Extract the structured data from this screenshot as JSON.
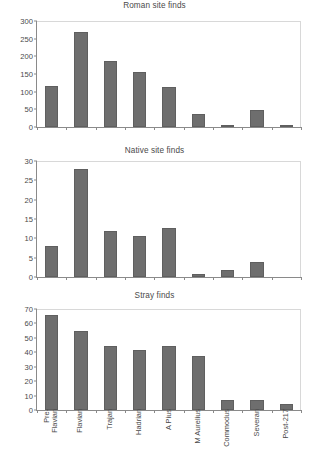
{
  "figure": {
    "background": "#ffffff",
    "bar_color": "#6e6e6e",
    "axis_color": "#8a8a8a",
    "text_color": "#4a4a4a"
  },
  "categories": [
    "Pre-\nFlavian",
    "Flavian",
    "Trajan",
    "Hadrian",
    "A Pius",
    "M Aurelius",
    "Commodus",
    "Severan",
    "Post-217"
  ],
  "charts": [
    {
      "title": "Roman site finds",
      "yticks": [
        "0",
        "50",
        "100",
        "150",
        "200",
        "250",
        "300"
      ],
      "values": [
        115,
        270,
        188,
        157,
        112,
        37,
        4,
        47,
        2
      ],
      "ylim_min": 0,
      "ylim_max": 300,
      "show_xlabels": false
    },
    {
      "title": "Native site finds",
      "yticks": [
        "0",
        "5",
        "10",
        "15",
        "20",
        "25",
        "30"
      ],
      "values": [
        8,
        28,
        12,
        10.7,
        12.7,
        0.8,
        1.8,
        3.8,
        0
      ],
      "ylim_min": 0,
      "ylim_max": 30,
      "show_xlabels": false
    },
    {
      "title": "Stray finds",
      "yticks": [
        "0",
        "10",
        "20",
        "30",
        "40",
        "50",
        "60",
        "70"
      ],
      "values": [
        66,
        55,
        44.7,
        41.5,
        44.3,
        37.2,
        7.2,
        7.2,
        4
      ],
      "ylim_min": 0,
      "ylim_max": 70,
      "show_xlabels": true
    }
  ],
  "chart_data": {
    "type": "bar",
    "xlabel": "",
    "ylabel": "",
    "grid": false,
    "legend": "none",
    "layout": "3 stacked panels, shared categories, rotated x tick labels on bottom panel only",
    "categories": [
      "Pre-Flavian",
      "Flavian",
      "Trajan",
      "Hadrian",
      "A Pius",
      "M Aurelius",
      "Commodus",
      "Severan",
      "Post-217"
    ],
    "panels": [
      {
        "title": "Roman site finds",
        "ylim": [
          0,
          300
        ],
        "ytick_step": 50,
        "ytick_labels": [
          "0",
          "50",
          "100",
          "150",
          "200",
          "250",
          "300"
        ],
        "values": [
          115,
          270,
          188,
          157,
          112,
          37,
          4,
          47,
          2
        ]
      },
      {
        "title": "Native site finds",
        "ylim": [
          0,
          30
        ],
        "ytick_step": 5,
        "ytick_labels": [
          "0",
          "5",
          "10",
          "15",
          "20",
          "25",
          "30"
        ],
        "values": [
          8,
          28,
          12,
          10.7,
          12.7,
          0.8,
          1.8,
          3.8,
          0
        ]
      },
      {
        "title": "Stray finds",
        "ylim": [
          0,
          70
        ],
        "ytick_step": 10,
        "ytick_labels": [
          "0",
          "10",
          "20",
          "30",
          "40",
          "50",
          "60",
          "70"
        ],
        "values": [
          66,
          55,
          44.7,
          41.5,
          44.3,
          37.2,
          7.2,
          7.2,
          4
        ]
      }
    ],
    "series": [
      {
        "name": "Roman site finds",
        "values": [
          115,
          270,
          188,
          157,
          112,
          37,
          4,
          47,
          2
        ]
      },
      {
        "name": "Native site finds",
        "values": [
          8,
          28,
          12,
          10.7,
          12.7,
          0.8,
          1.8,
          3.8,
          0
        ]
      },
      {
        "name": "Stray finds",
        "values": [
          66,
          55,
          44.7,
          41.5,
          44.3,
          37.2,
          7.2,
          7.2,
          4
        ]
      }
    ]
  }
}
